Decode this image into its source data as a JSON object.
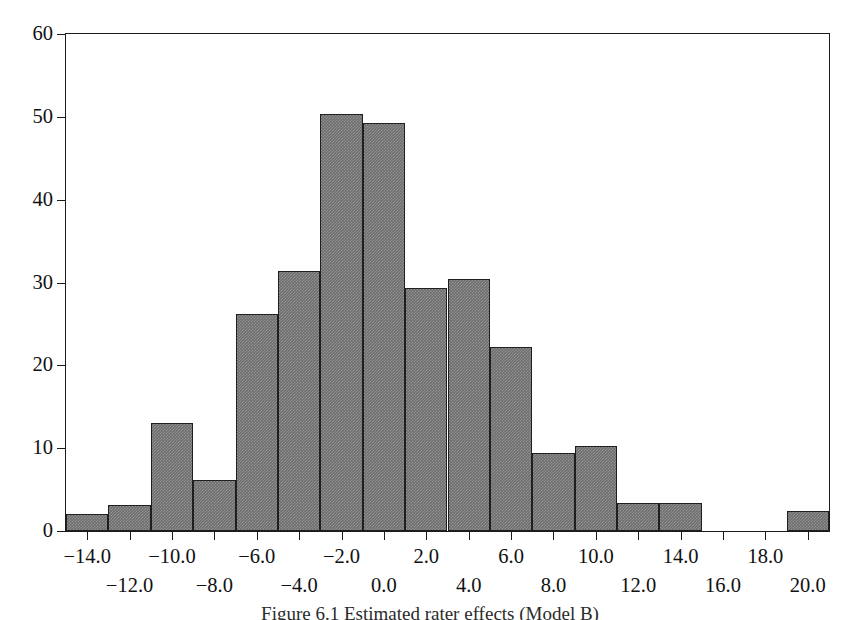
{
  "figure": {
    "caption": "Figure 6.1  Estimated rater effects (Model B)"
  },
  "chart_data": {
    "type": "bar",
    "title": "",
    "xlabel": "",
    "ylabel": "",
    "grid": false,
    "legend": null,
    "bin_width": 2.0,
    "xlim": [
      -15.0,
      21.0
    ],
    "ylim": [
      0,
      60
    ],
    "x_tick_values": [
      -14.0,
      -12.0,
      -10.0,
      -8.0,
      -6.0,
      -4.0,
      -2.0,
      0.0,
      2.0,
      4.0,
      6.0,
      8.0,
      10.0,
      12.0,
      14.0,
      16.0,
      18.0,
      20.0
    ],
    "x_tick_labels": [
      "-14.0",
      "-12.0",
      "-10.0",
      "-8.0",
      "-6.0",
      "-4.0",
      "-2.0",
      "0.0",
      "2.0",
      "4.0",
      "6.0",
      "8.0",
      "10.0",
      "12.0",
      "14.0",
      "16.0",
      "18.0",
      "20.0"
    ],
    "x_tick_rows": [
      0,
      1,
      0,
      1,
      0,
      1,
      0,
      1,
      0,
      1,
      0,
      1,
      0,
      1,
      0,
      1,
      0,
      1
    ],
    "y_tick_values": [
      0,
      10,
      20,
      30,
      40,
      50,
      60
    ],
    "y_tick_labels": [
      "0",
      "10",
      "20",
      "30",
      "40",
      "50",
      "60"
    ],
    "bin_edges": [
      -15.0,
      -13.0,
      -11.0,
      -9.0,
      -7.0,
      -5.0,
      -3.0,
      -1.0,
      1.0,
      3.0,
      5.0,
      7.0,
      9.0,
      11.0,
      13.0,
      15.0,
      17.0,
      19.0,
      21.0
    ],
    "bin_centers": [
      -14.0,
      -12.0,
      -10.0,
      -8.0,
      -6.0,
      -4.0,
      -2.0,
      0.0,
      2.0,
      4.0,
      6.0,
      8.0,
      10.0,
      12.0,
      14.0,
      16.0,
      18.0,
      20.0
    ],
    "values": [
      2.1,
      3.2,
      13.1,
      6.2,
      26.2,
      31.4,
      50.3,
      49.3,
      29.3,
      30.4,
      22.2,
      9.4,
      10.3,
      3.4,
      3.4,
      0,
      0,
      2.4
    ],
    "bar_fill_color": "#6e6e6e",
    "bar_edge_color": "#1f1f1f",
    "axis_color": "#1b1b1b",
    "background_color": "#ffffff"
  }
}
